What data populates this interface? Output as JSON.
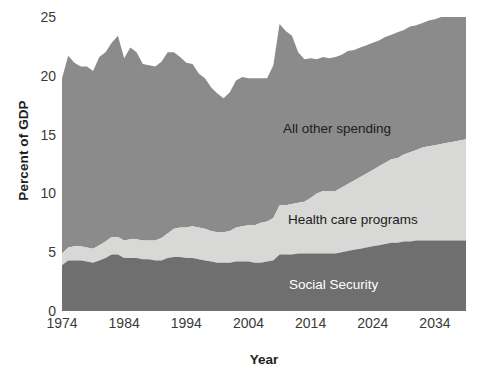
{
  "chart_data": {
    "type": "area",
    "stacked": true,
    "title": "",
    "xlabel": "Year",
    "ylabel": "Percent of GDP",
    "xlim": [
      1974,
      2039
    ],
    "ylim": [
      0,
      25
    ],
    "yticks": [
      0,
      5,
      10,
      15,
      20,
      25
    ],
    "xticks": [
      1974,
      1984,
      1994,
      2004,
      2014,
      2024,
      2034
    ],
    "grid": false,
    "legend_position": "inline-annotations",
    "colors": {
      "social_security": "#6f6f6f",
      "health_care": "#d8d8d6",
      "all_other": "#8b8b8b",
      "background": "#ffffff",
      "text": "#231f20",
      "tick_text": "#3a3a3a",
      "label_on_dark": "#ffffff"
    },
    "annotations": [
      {
        "name": "all-other-spending",
        "text": "All other spending"
      },
      {
        "name": "health-care-programs",
        "text": "Health care programs"
      },
      {
        "name": "social-security",
        "text": "Social Security"
      }
    ],
    "x": [
      1974,
      1975,
      1976,
      1977,
      1978,
      1979,
      1980,
      1981,
      1982,
      1983,
      1984,
      1985,
      1986,
      1987,
      1988,
      1989,
      1990,
      1991,
      1992,
      1993,
      1994,
      1995,
      1996,
      1997,
      1998,
      1999,
      2000,
      2001,
      2002,
      2003,
      2004,
      2005,
      2006,
      2007,
      2008,
      2009,
      2010,
      2011,
      2012,
      2013,
      2014,
      2015,
      2016,
      2017,
      2018,
      2019,
      2020,
      2021,
      2022,
      2023,
      2024,
      2025,
      2026,
      2027,
      2028,
      2029,
      2030,
      2031,
      2032,
      2033,
      2034,
      2035,
      2036,
      2037,
      2038,
      2039
    ],
    "series": [
      {
        "name": "Social Security",
        "values": [
          3.9,
          4.3,
          4.3,
          4.3,
          4.2,
          4.1,
          4.3,
          4.5,
          4.8,
          4.8,
          4.5,
          4.5,
          4.5,
          4.4,
          4.4,
          4.3,
          4.3,
          4.5,
          4.6,
          4.6,
          4.5,
          4.5,
          4.4,
          4.3,
          4.2,
          4.1,
          4.1,
          4.1,
          4.2,
          4.2,
          4.2,
          4.1,
          4.1,
          4.2,
          4.3,
          4.8,
          4.8,
          4.8,
          4.9,
          4.9,
          4.9,
          4.9,
          4.9,
          4.9,
          4.9,
          5.0,
          5.1,
          5.2,
          5.3,
          5.4,
          5.5,
          5.6,
          5.7,
          5.8,
          5.8,
          5.9,
          5.9,
          6.0,
          6.0,
          6.0,
          6.0,
          6.0,
          6.0,
          6.0,
          6.0,
          6.0
        ]
      },
      {
        "name": "Health care programs",
        "values": [
          1.0,
          1.1,
          1.2,
          1.2,
          1.2,
          1.2,
          1.3,
          1.4,
          1.5,
          1.5,
          1.5,
          1.6,
          1.6,
          1.6,
          1.6,
          1.7,
          1.9,
          2.1,
          2.4,
          2.5,
          2.6,
          2.7,
          2.7,
          2.7,
          2.6,
          2.6,
          2.6,
          2.7,
          2.9,
          3.0,
          3.1,
          3.2,
          3.4,
          3.4,
          3.6,
          4.2,
          4.2,
          4.3,
          4.3,
          4.4,
          4.7,
          5.1,
          5.3,
          5.3,
          5.3,
          5.5,
          5.7,
          5.9,
          6.1,
          6.3,
          6.5,
          6.7,
          6.9,
          7.1,
          7.2,
          7.4,
          7.6,
          7.7,
          7.9,
          8.0,
          8.1,
          8.2,
          8.3,
          8.4,
          8.5,
          8.6
        ]
      },
      {
        "name": "All other spending",
        "values": [
          14.9,
          16.3,
          15.6,
          15.3,
          15.4,
          15.1,
          16.0,
          16.1,
          16.5,
          17.1,
          15.5,
          16.3,
          15.9,
          15.0,
          14.9,
          14.8,
          15.0,
          15.4,
          15.0,
          14.5,
          14.0,
          13.8,
          13.1,
          12.8,
          12.2,
          11.8,
          11.4,
          11.8,
          12.5,
          12.7,
          12.5,
          12.5,
          12.3,
          12.2,
          13.0,
          15.4,
          14.8,
          14.3,
          12.8,
          12.1,
          11.9,
          11.4,
          11.4,
          11.3,
          11.4,
          11.3,
          11.3,
          11.1,
          11.0,
          10.9,
          10.8,
          10.7,
          10.7,
          10.6,
          10.7,
          10.6,
          10.7,
          10.6,
          10.6,
          10.7,
          10.7,
          10.8,
          10.8,
          10.9,
          10.9,
          11.0
        ]
      }
    ],
    "totals_note": "Stacked totals range from about 18 percent of GDP near 2000 to a peak near 24.4 percent in 2009."
  },
  "axis": {
    "y_title": "Percent of GDP",
    "x_title": "Year"
  }
}
